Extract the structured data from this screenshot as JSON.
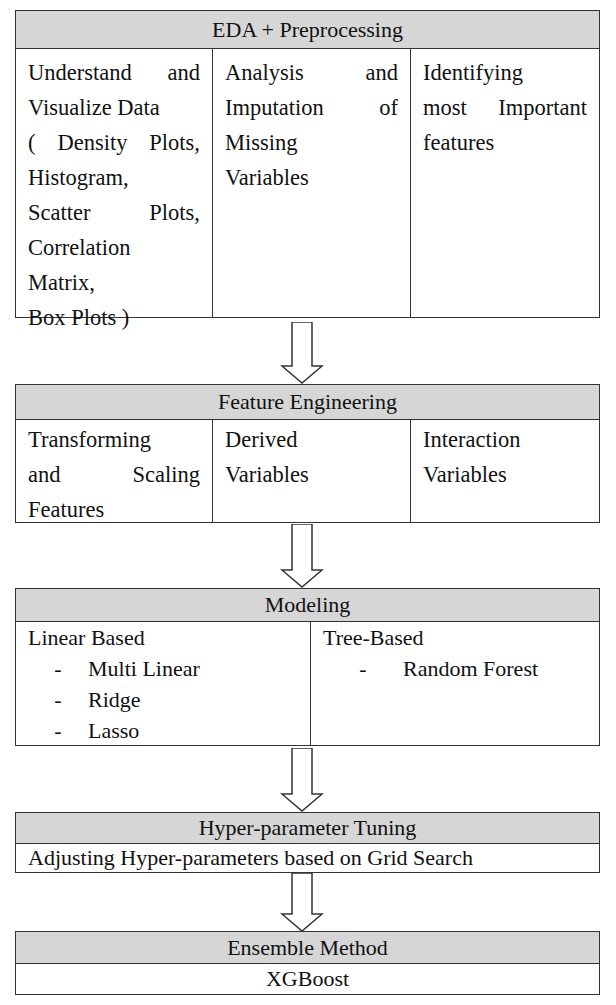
{
  "stages": [
    {
      "title": "EDA + Preprocessing",
      "columns": [
        {
          "lines": [
            "Understand and",
            "Visualize Data",
            "( Density Plots,",
            "Histogram,",
            "Scatter Plots,",
            "Correlation",
            "Matrix,",
            "Box Plots )"
          ]
        },
        {
          "lines": [
            "Analysis and",
            "Imputation of",
            "Missing",
            "Variables"
          ]
        },
        {
          "lines": [
            "Identifying",
            "most Important",
            "features"
          ]
        }
      ]
    },
    {
      "title": "Feature Engineering",
      "columns": [
        {
          "lines": [
            "Transforming",
            "and Scaling",
            "Features"
          ]
        },
        {
          "lines": [
            "Derived",
            "Variables"
          ]
        },
        {
          "lines": [
            "Interaction",
            "Variables"
          ]
        }
      ]
    },
    {
      "title": "Modeling",
      "columns": [
        {
          "heading": "Linear Based",
          "items": [
            "Multi Linear",
            "Ridge",
            "Lasso"
          ]
        },
        {
          "heading": "Tree-Based",
          "items": [
            "Random Forest"
          ]
        }
      ]
    },
    {
      "title": "Hyper-parameter Tuning",
      "body": "Adjusting Hyper-parameters based on Grid Search"
    },
    {
      "title": "Ensemble Method",
      "body": "XGBoost"
    }
  ],
  "bullet_glyph": "-",
  "colors": {
    "header_fill": "#d6d6d6",
    "border": "#333333"
  }
}
